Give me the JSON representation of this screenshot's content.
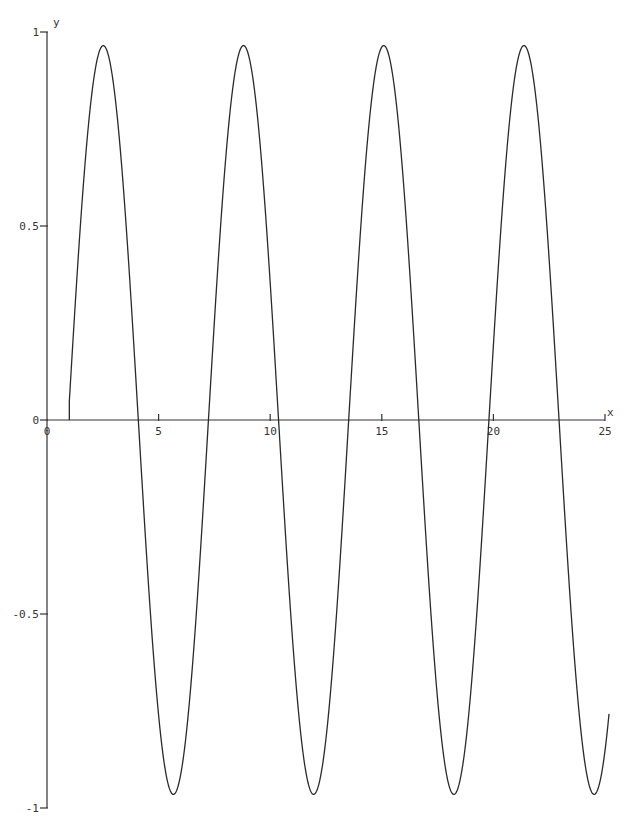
{
  "chart_data": {
    "type": "line",
    "title": "",
    "xlabel": "x",
    "ylabel": "y",
    "xlim": [
      0,
      25
    ],
    "ylim": [
      -1,
      1
    ],
    "grid": false,
    "legend": null,
    "x_ticks": [
      {
        "value": 0,
        "label": "0"
      },
      {
        "value": 5,
        "label": "5"
      },
      {
        "value": 10,
        "label": "10"
      },
      {
        "value": 15,
        "label": "15"
      },
      {
        "value": 20,
        "label": "20"
      },
      {
        "value": 25,
        "label": "25"
      }
    ],
    "y_ticks": [
      {
        "value": 1,
        "label": "1"
      },
      {
        "value": 0.5,
        "label": "0.5"
      },
      {
        "value": 0,
        "label": "0"
      },
      {
        "value": -0.5,
        "label": "-0.5"
      },
      {
        "value": -1,
        "label": "-1"
      }
    ],
    "series": [
      {
        "name": "y",
        "description": "sinusoid starting at x≈1, approx y = 0.965·sin(x − 0.95)",
        "model": {
          "amplitude": 0.965,
          "phase": 0.95,
          "x_start": 1.0,
          "x_end": 25.18
        },
        "x": [
          1.0,
          2.42,
          4.08,
          5.82,
          7.21,
          8.74,
          10.35,
          12.1,
          13.5,
          15.05,
          16.65,
          18.4,
          19.8,
          21.37,
          22.95,
          24.69,
          25.18
        ],
        "y": [
          0.0,
          0.96,
          0.0,
          -0.96,
          0.0,
          0.97,
          0.0,
          -0.96,
          0.0,
          0.97,
          0.0,
          -0.96,
          0.0,
          0.97,
          0.0,
          -0.96,
          -0.83
        ]
      }
    ]
  },
  "axes": {
    "x_label": "x",
    "y_label": "y"
  }
}
